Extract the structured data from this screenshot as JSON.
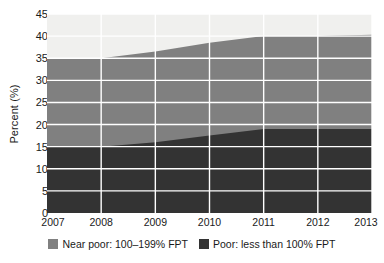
{
  "chart_data": {
    "type": "area",
    "stacked": true,
    "title": "",
    "subtitle": "",
    "xlabel": "",
    "ylabel": "Percent (%)",
    "x": [
      2007,
      2008,
      2009,
      2010,
      2011,
      2012,
      2013
    ],
    "xtick_labels": [
      "2007",
      "2008",
      "2009",
      "2010",
      "2011",
      "2012",
      "2013"
    ],
    "xlim": [
      2007,
      2013
    ],
    "ylim": [
      0,
      45
    ],
    "ytick_labels": [
      "0",
      "5",
      "10",
      "15",
      "20",
      "25",
      "30",
      "35",
      "40",
      "45"
    ],
    "ytick_values": [
      0,
      5,
      10,
      15,
      20,
      25,
      30,
      35,
      40,
      45
    ],
    "grid": true,
    "grid_color": "#ffffff",
    "plot_background": "#f0f0ee",
    "legend_position": "bottom",
    "series": [
      {
        "name": "Poor: less than 100% FPT",
        "color": "#333333",
        "values": [
          15.0,
          15.0,
          16.0,
          17.5,
          19.0,
          19.0,
          19.0
        ]
      },
      {
        "name": "Near poor: 100–199% FPT",
        "color": "#808080",
        "values": [
          20.0,
          20.0,
          20.5,
          21.0,
          21.0,
          21.0,
          21.3
        ]
      }
    ],
    "cumulative_top": [
      35.0,
      35.0,
      36.5,
      38.5,
      40.0,
      40.0,
      40.3
    ]
  },
  "legend": {
    "entries": [
      {
        "label": "Near poor: 100–199% FPT",
        "color": "#808080",
        "swatch_name": "near-poor-swatch"
      },
      {
        "label": "Poor: less than 100% FPT",
        "color": "#333333",
        "swatch_name": "poor-swatch"
      }
    ]
  },
  "colors": {
    "near_poor": "#808080",
    "poor": "#333333",
    "plot_bg": "#f0f0ee",
    "gridline": "#ffffff",
    "text": "#1a1a1a"
  }
}
